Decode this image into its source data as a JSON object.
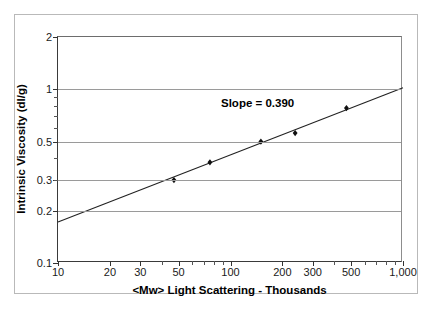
{
  "chart_data": {
    "type": "scatter",
    "title": "",
    "xlabel": "<Mw> Light Scattering  - Thousands",
    "ylabel": "Intrinsic Viscosity (dl/g)",
    "xscale": "log",
    "yscale": "log",
    "xlim": [
      10,
      1000
    ],
    "ylim": [
      0.1,
      2
    ],
    "grid": "horizontal",
    "legend": "none",
    "x_ticklabels": [
      "10",
      "20",
      "30",
      "50",
      "100",
      "200",
      "300",
      "500",
      "1,000"
    ],
    "x_tickvalues": [
      10,
      20,
      30,
      50,
      100,
      200,
      300,
      500,
      1000
    ],
    "y_ticklabels": [
      "2",
      "1",
      "0.5",
      "0.3",
      "0.2",
      "0.1"
    ],
    "y_tickvalues": [
      2,
      1,
      0.5,
      0.3,
      0.2,
      0.1
    ],
    "gridline_values": [
      2,
      1,
      0.5,
      0.3,
      0.2,
      0.1
    ],
    "series": [
      {
        "name": "Intrinsic Viscosity vs Mw",
        "marker": "diamond",
        "marker_color": "#111111",
        "points": [
          {
            "x": 47,
            "y": 0.3
          },
          {
            "x": 76,
            "y": 0.38
          },
          {
            "x": 150,
            "y": 0.5
          },
          {
            "x": 237,
            "y": 0.56
          },
          {
            "x": 470,
            "y": 0.78
          }
        ]
      }
    ],
    "fit_line": {
      "name": "Mark-Houwink fit",
      "slope": 0.39,
      "color": "#222222",
      "x_start": 10,
      "y_start": 0.172,
      "x_end": 1000,
      "y_end": 1.02
    },
    "annotations": [
      {
        "text": "Slope = 0.390",
        "x": 130,
        "y": 0.95
      }
    ]
  },
  "axes": {
    "y_title": "Intrinsic Viscosity (dl/g)",
    "x_title": "<Mw> Light Scattering  - Thousands"
  },
  "annotation": {
    "slope_text": "Slope = 0.390"
  },
  "colors": {
    "gridline": "#9a9a9a",
    "axis": "#3a3a3a",
    "marker": "#111111",
    "line": "#222222",
    "frame": "#b9b9b9",
    "background": "#ffffff"
  }
}
